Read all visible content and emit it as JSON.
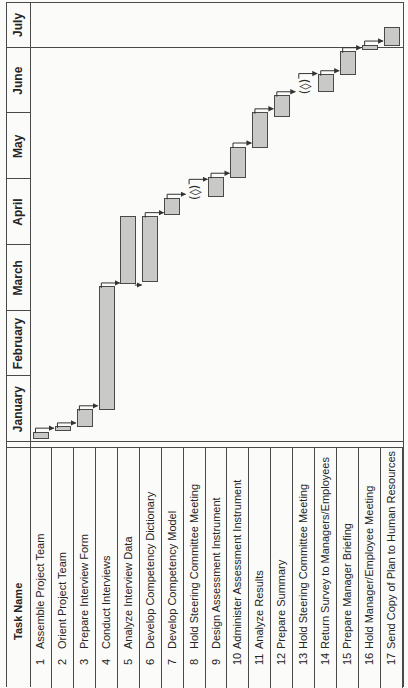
{
  "figure": {
    "background": "#fbfbf9",
    "line_color": "#4a4a4a",
    "bar_fill": "#c9c9c7",
    "bar_stroke": "#4a4a4a",
    "connector_color": "#333333",
    "text_color": "#242424"
  },
  "table": {
    "header": "Task Name"
  },
  "chart_data": {
    "type": "gantt",
    "title": "",
    "months": [
      "January",
      "February",
      "March",
      "April",
      "May",
      "June",
      "July"
    ],
    "time_unit": "months from January start (0 = Jan 1, 7 = end of July)",
    "gridline_at_month_boundary": "July",
    "legend_position": "none",
    "milestone_symbol": "(◊)",
    "tasks": [
      {
        "id": 1,
        "name": "Assemble Project Team",
        "start": 0.05,
        "end": 0.15,
        "milestone": false
      },
      {
        "id": 2,
        "name": "Orient Project Team",
        "start": 0.17,
        "end": 0.23,
        "milestone": false
      },
      {
        "id": 3,
        "name": "Prepare Interview Form",
        "start": 0.23,
        "end": 0.49,
        "milestone": false
      },
      {
        "id": 4,
        "name": "Conduct Interviews",
        "start": 0.5,
        "end": 2.36,
        "milestone": false
      },
      {
        "id": 5,
        "name": "Analyze Interview Data",
        "start": 2.42,
        "end": 3.43,
        "milestone": false
      },
      {
        "id": 6,
        "name": "Develop Competency Dictionary",
        "start": 2.44,
        "end": 3.43,
        "milestone": false
      },
      {
        "id": 7,
        "name": "Develop Competency Model",
        "start": 3.46,
        "end": 3.71,
        "milestone": false
      },
      {
        "id": 8,
        "name": "Hold Steering Committee Meeting",
        "at": 3.8,
        "milestone": true
      },
      {
        "id": 9,
        "name": "Design Assessment Instrument",
        "start": 3.73,
        "end": 4.03,
        "milestone": false
      },
      {
        "id": 10,
        "name": "Administer Assessment Instrument",
        "start": 4.03,
        "end": 4.49,
        "milestone": false
      },
      {
        "id": 11,
        "name": "Analyze Results",
        "start": 4.49,
        "end": 5.01,
        "milestone": false
      },
      {
        "id": 12,
        "name": "Prepare Summary",
        "start": 4.96,
        "end": 5.27,
        "milestone": false
      },
      {
        "id": 13,
        "name": "Hold Steering Committee Meeting",
        "at": 5.41,
        "milestone": true
      },
      {
        "id": 14,
        "name": "Return Survey to Managers/Employees",
        "start": 5.33,
        "end": 5.59,
        "milestone": false
      },
      {
        "id": 15,
        "name": "Prepare Manager Briefing",
        "start": 5.59,
        "end": 5.94,
        "milestone": false
      },
      {
        "id": 16,
        "name": "Hold Manager/Employee Meeting",
        "start": 5.97,
        "end": 6.06,
        "milestone": false
      },
      {
        "id": 17,
        "name": "Send Copy of Plan to Human Resources",
        "start": 6.04,
        "end": 6.45,
        "milestone": false
      }
    ],
    "links": [
      {
        "from": 1,
        "to": 2,
        "type": "fs"
      },
      {
        "from": 2,
        "to": 3,
        "type": "fs"
      },
      {
        "from": 3,
        "to": 4,
        "type": "fs"
      },
      {
        "from": 4,
        "to": 5,
        "type": "fs"
      },
      {
        "from": 5,
        "to": 6,
        "type": "ss"
      },
      {
        "from": 6,
        "to": 7,
        "type": "fs"
      },
      {
        "from": 7,
        "to": 8,
        "type": "fs"
      },
      {
        "from": 8,
        "to": 9,
        "type": "fs"
      },
      {
        "from": 9,
        "to": 10,
        "type": "fs"
      },
      {
        "from": 10,
        "to": 11,
        "type": "fs"
      },
      {
        "from": 11,
        "to": 12,
        "type": "fs"
      },
      {
        "from": 12,
        "to": 13,
        "type": "fs"
      },
      {
        "from": 13,
        "to": 14,
        "type": "fs"
      },
      {
        "from": 14,
        "to": 15,
        "type": "fs"
      },
      {
        "from": 15,
        "to": 16,
        "type": "fs"
      },
      {
        "from": 16,
        "to": 17,
        "type": "fs"
      }
    ]
  }
}
